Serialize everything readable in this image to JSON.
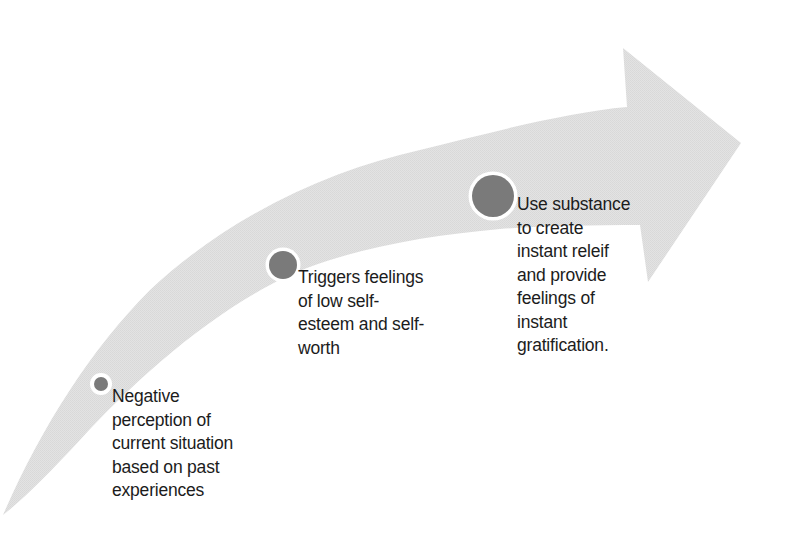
{
  "diagram": {
    "type": "curved-arrow-process",
    "direction": "bottom-left to top-right",
    "colors": {
      "arrow_fill": "#e2e2e2",
      "marker_fill": "#7a7a7a",
      "marker_ring": "#ffffff",
      "text": "#1c1c1c",
      "background": "#ffffff"
    },
    "steps": [
      {
        "order": 1,
        "marker_size": "small",
        "text": "Negative\nperception of\ncurrent situation\nbased on past\nexperiences"
      },
      {
        "order": 2,
        "marker_size": "medium",
        "text": "Triggers feelings\nof low self-\nesteem and self-\nworth"
      },
      {
        "order": 3,
        "marker_size": "large",
        "text": "Use substance\nto create\ninstant releif\nand provide\nfeelings of\ninstant\ngratification."
      }
    ]
  }
}
